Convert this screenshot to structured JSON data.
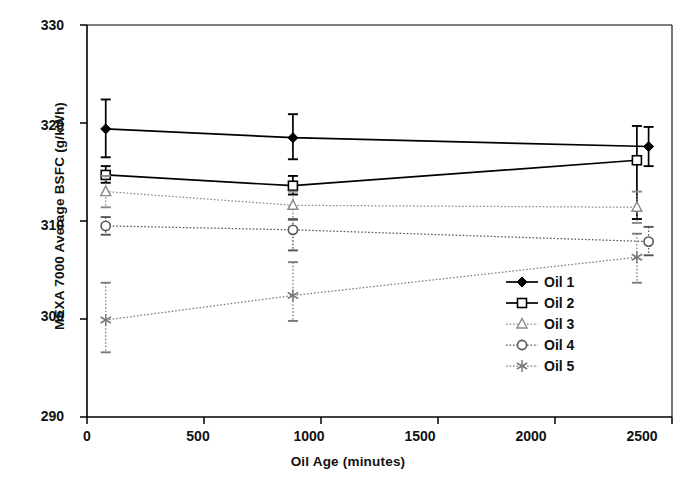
{
  "chart_data": {
    "type": "line",
    "title": "",
    "xlabel": "Oil Age (minutes)",
    "ylabel": "MEXA 7000 Average BSFC (g/kWh)",
    "xlim": [
      0,
      2500
    ],
    "ylim": [
      290,
      330
    ],
    "xticks": [
      0,
      500,
      1000,
      1500,
      2000,
      2500
    ],
    "yticks": [
      290,
      300,
      310,
      320,
      330
    ],
    "xtick_labels": [
      "0",
      "500",
      "1000",
      "1500",
      "2000",
      "2500"
    ],
    "ytick_labels": [
      "290",
      "300",
      "310",
      "320",
      "330"
    ],
    "grid": false,
    "legend_position": "inside-lower-right",
    "error_bars": true,
    "series": [
      {
        "name": "Oil 1",
        "marker": "filled-diamond",
        "line": "solid",
        "color": "#000000",
        "x": [
          80,
          880,
          2400
        ],
        "y": [
          319.4,
          318.5,
          317.6
        ],
        "yerr_low": [
          2.9,
          2.2,
          2.0
        ],
        "yerr_high": [
          3.0,
          2.4,
          2.0
        ]
      },
      {
        "name": "Oil 2",
        "marker": "open-square",
        "line": "solid",
        "color": "#000000",
        "x": [
          80,
          880,
          2350
        ],
        "y": [
          314.7,
          313.6,
          316.2
        ],
        "yerr_low": [
          0.8,
          0.9,
          6.0
        ],
        "yerr_high": [
          0.9,
          1.0,
          3.5
        ]
      },
      {
        "name": "Oil 3",
        "marker": "open-triangle",
        "line": "dotted",
        "color": "#8a8a8a",
        "x": [
          80,
          880,
          2350
        ],
        "y": [
          313.0,
          311.6,
          311.4
        ],
        "yerr_low": [
          1.6,
          1.5,
          1.6
        ],
        "yerr_high": [
          1.6,
          1.4,
          1.6
        ]
      },
      {
        "name": "Oil 4",
        "marker": "open-circle",
        "line": "dotted",
        "color": "#555555",
        "x": [
          80,
          880,
          2400
        ],
        "y": [
          309.5,
          309.1,
          307.9
        ],
        "yerr_low": [
          0.9,
          2.1,
          1.4
        ],
        "yerr_high": [
          0.9,
          1.1,
          1.5
        ]
      },
      {
        "name": "Oil 5",
        "marker": "asterisk",
        "line": "dotted",
        "color": "#7a7a7a",
        "x": [
          80,
          880,
          2350
        ],
        "y": [
          299.9,
          302.4,
          306.3
        ],
        "yerr_low": [
          3.3,
          2.6,
          2.6
        ],
        "yerr_high": [
          3.8,
          3.4,
          2.4
        ]
      }
    ]
  },
  "legend": {
    "items": [
      {
        "label": "Oil 1"
      },
      {
        "label": "Oil 2"
      },
      {
        "label": "Oil 3"
      },
      {
        "label": "Oil 4"
      },
      {
        "label": "Oil 5"
      }
    ]
  }
}
